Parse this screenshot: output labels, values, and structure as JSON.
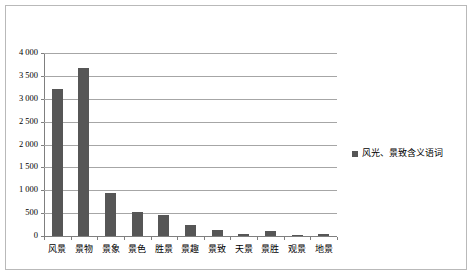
{
  "chart_data": {
    "type": "bar",
    "title": "",
    "subtitle": "",
    "xlabel": "",
    "ylabel": "",
    "categories": [
      "风景",
      "景物",
      "景象",
      "景色",
      "胜景",
      "景趣",
      "景致",
      "天景",
      "景胜",
      "观景",
      "地景"
    ],
    "series": [
      {
        "name": "风光、景致含义语词",
        "values": [
          3215,
          3670,
          950,
          530,
          465,
          230,
          140,
          35,
          105,
          30,
          35
        ],
        "color": "#565656"
      }
    ],
    "ylim": [
      0,
      4000
    ],
    "ytick_values": [
      0,
      500,
      1000,
      1500,
      2000,
      2500,
      3000,
      3500,
      4000
    ],
    "ytick_labels": [
      "0",
      "500",
      "1 000",
      "1 500",
      "2 000",
      "2 500",
      "3 000",
      "3 500",
      "4 000"
    ],
    "grid": true,
    "grid_axis": "y",
    "legend": {
      "position": "right",
      "entries": [
        {
          "label": "风光、景致含义语词",
          "marker": "square",
          "color": "#565656"
        }
      ]
    },
    "axis_color": "#7f7f7f",
    "grid_color": "#a6a6a6",
    "frame_color": "#b9b9b9",
    "background": "#ffffff"
  }
}
